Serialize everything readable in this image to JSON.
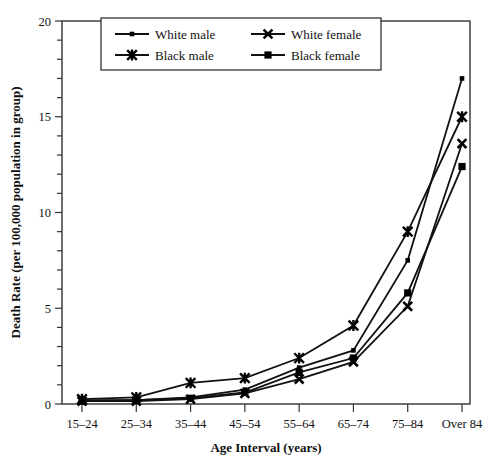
{
  "chart_data": {
    "type": "line",
    "title": "",
    "xlabel": "Age Interval (years)",
    "ylabel": "Death Rate (per 100,000 population in group)",
    "categories": [
      "15–24",
      "25–34",
      "35–44",
      "45–54",
      "55–64",
      "65–74",
      "75–84",
      "Over 84"
    ],
    "ylim": [
      0,
      20
    ],
    "yticks": [
      0,
      5,
      10,
      15,
      20
    ],
    "yticklabels": [
      "0",
      "5",
      "10",
      "15",
      "20"
    ],
    "minor_tick_step": 1,
    "grid": false,
    "legend_position": "top-center",
    "series": [
      {
        "name": "White male",
        "marker": "square-small",
        "values": [
          0.2,
          0.2,
          0.35,
          0.75,
          1.9,
          2.8,
          7.5,
          17.0
        ]
      },
      {
        "name": "White female",
        "marker": "x",
        "values": [
          0.15,
          0.15,
          0.25,
          0.55,
          1.3,
          2.2,
          5.1,
          13.6
        ]
      },
      {
        "name": "Black male",
        "marker": "star",
        "values": [
          0.25,
          0.35,
          1.1,
          1.35,
          2.4,
          4.1,
          9.0,
          15.0
        ]
      },
      {
        "name": "Black female",
        "marker": "square-large",
        "values": [
          0.15,
          0.2,
          0.3,
          0.6,
          1.65,
          2.4,
          5.8,
          12.4
        ]
      }
    ]
  },
  "legend": {
    "entries": [
      {
        "label": "White male",
        "marker": "square-small"
      },
      {
        "label": "White female",
        "marker": "x"
      },
      {
        "label": "Black male",
        "marker": "star"
      },
      {
        "label": "Black female",
        "marker": "square-large"
      }
    ]
  },
  "axes": {
    "x_title": "Age Interval (years)",
    "y_title": "Death Rate (per 100,000 population in group)",
    "x_categories": [
      "15–24",
      "25–34",
      "35–44",
      "45–54",
      "55–64",
      "65–74",
      "75–84",
      "Over 84"
    ],
    "y_tick_labels": [
      "0",
      "5",
      "10",
      "15",
      "20"
    ]
  },
  "colors": {
    "line": "#111111",
    "marker": "#000000",
    "axis": "#333333",
    "background": "#ffffff"
  }
}
